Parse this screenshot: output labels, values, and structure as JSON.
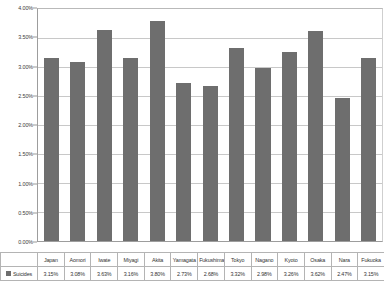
{
  "chart_data": {
    "type": "bar",
    "title": "",
    "xlabel": "",
    "ylabel": "",
    "ylim": [
      0,
      4
    ],
    "ytick_labels": [
      "4.00%",
      "3.50%",
      "3.00%",
      "2.50%",
      "2.00%",
      "1.50%",
      "1.00%",
      "0.50%",
      "0.00%"
    ],
    "ytick_values": [
      4.0,
      3.5,
      3.0,
      2.5,
      2.0,
      1.5,
      1.0,
      0.5,
      0.0
    ],
    "grid": true,
    "legend_position": "bottom-left",
    "series_name": "Suicides",
    "series_color": "#6e6e6e",
    "categories": [
      "Japan",
      "Aomori",
      "Iwate",
      "Miyagi",
      "Akita",
      "Yamagata",
      "Fukushima",
      "Tokyo",
      "Nagano",
      "Kyoto",
      "Osaka",
      "Nara",
      "Fukuoka"
    ],
    "values": [
      3.15,
      3.08,
      3.63,
      3.16,
      3.8,
      2.73,
      2.68,
      3.32,
      2.98,
      3.26,
      3.62,
      2.47,
      3.15
    ],
    "value_labels": [
      "3.15%",
      "3.08%",
      "3.63%",
      "3.16%",
      "3.80%",
      "2.73%",
      "2.68%",
      "3.32%",
      "2.98%",
      "3.26%",
      "3.62%",
      "2.47%",
      "3.15%"
    ],
    "series": [
      {
        "name": "Suicides",
        "values": [
          3.15,
          3.08,
          3.63,
          3.16,
          3.8,
          2.73,
          2.68,
          3.32,
          2.98,
          3.26,
          3.62,
          2.47,
          3.15
        ]
      }
    ]
  },
  "legend": {
    "label": "Suicides",
    "swatch_color": "#6e6e6e"
  }
}
